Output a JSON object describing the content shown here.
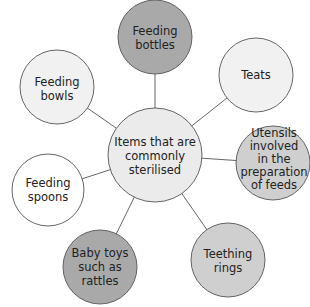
{
  "diagram": {
    "type": "spider-diagram",
    "center": {
      "lines": [
        "Items that are",
        "commonly",
        "sterilised"
      ],
      "fill": "#ebebeb"
    },
    "nodes": [
      {
        "id": "feeding-bottles",
        "lines": [
          "Feeding",
          "bottles"
        ],
        "fill": "#a9a9a9"
      },
      {
        "id": "teats",
        "lines": [
          "Teats"
        ],
        "fill": "#f1f1f1"
      },
      {
        "id": "utensils",
        "lines": [
          "Utensils",
          "involved",
          "in the",
          "preparation",
          "of feeds"
        ],
        "fill": "#cfcfcf"
      },
      {
        "id": "teething-rings",
        "lines": [
          "Teething",
          "rings"
        ],
        "fill": "#cfcfcf"
      },
      {
        "id": "baby-toys",
        "lines": [
          "Baby toys",
          "such as",
          "rattles"
        ],
        "fill": "#a9a9a9"
      },
      {
        "id": "feeding-spoons",
        "lines": [
          "Feeding",
          "spoons"
        ],
        "fill": "#ffffff"
      },
      {
        "id": "feeding-bowls",
        "lines": [
          "Feeding",
          "bowls"
        ],
        "fill": "#f1f1f1"
      }
    ],
    "colors": {
      "stroke": "#555555",
      "text": "#222222"
    }
  }
}
